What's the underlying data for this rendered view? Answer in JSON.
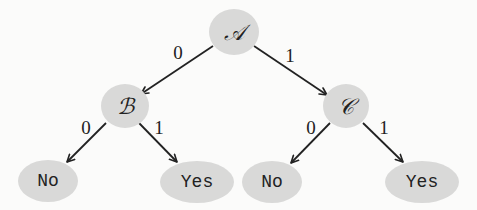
{
  "diagram": {
    "type": "binary-decision-tree",
    "colors": {
      "node_fill": "#d9d9d8",
      "edge": "#222222",
      "text": "#222222",
      "background": "#fbfbfa"
    },
    "nodes": {
      "A": {
        "label": "𝒜",
        "cx": 234,
        "cy": 32,
        "w": 50,
        "h": 46
      },
      "B": {
        "label": "ℬ",
        "cx": 125,
        "cy": 106,
        "w": 48,
        "h": 44
      },
      "C": {
        "label": "𝒞",
        "cx": 346,
        "cy": 106,
        "w": 46,
        "h": 44
      },
      "B0": {
        "label": "No",
        "cx": 48,
        "cy": 181,
        "w": 60,
        "h": 42
      },
      "B1": {
        "label": "Yes",
        "cx": 197,
        "cy": 182,
        "w": 74,
        "h": 42
      },
      "C0": {
        "label": "No",
        "cx": 272,
        "cy": 182,
        "w": 60,
        "h": 42
      },
      "C1": {
        "label": "Yes",
        "cx": 422,
        "cy": 182,
        "w": 74,
        "h": 42
      }
    },
    "edges": [
      {
        "from": "A",
        "to": "B",
        "label": "0",
        "x1": 213,
        "y1": 46,
        "x2": 141,
        "y2": 94,
        "lx": 178,
        "ly": 52
      },
      {
        "from": "A",
        "to": "C",
        "label": "1",
        "x1": 254,
        "y1": 46,
        "x2": 327,
        "y2": 95,
        "lx": 290,
        "ly": 55
      },
      {
        "from": "B",
        "to": "B0",
        "label": "0",
        "x1": 106,
        "y1": 123,
        "x2": 67,
        "y2": 162,
        "lx": 86,
        "ly": 127
      },
      {
        "from": "B",
        "to": "B1",
        "label": "1",
        "x1": 139,
        "y1": 123,
        "x2": 177,
        "y2": 162,
        "lx": 159,
        "ly": 127
      },
      {
        "from": "C",
        "to": "C0",
        "label": "0",
        "x1": 330,
        "y1": 123,
        "x2": 291,
        "y2": 163,
        "lx": 311,
        "ly": 127
      },
      {
        "from": "C",
        "to": "C1",
        "label": "1",
        "x1": 363,
        "y1": 123,
        "x2": 403,
        "y2": 162,
        "lx": 384,
        "ly": 127
      }
    ]
  }
}
